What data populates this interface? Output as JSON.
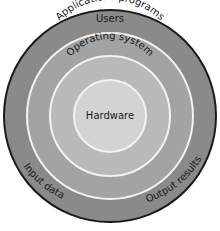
{
  "diagram": {
    "layers": [
      {
        "label": "Users",
        "color": "#8a8a8a"
      },
      {
        "label": "Applications programs",
        "color": "#a3a3a3"
      },
      {
        "label": "Operating system",
        "color": "#b9b9b9"
      },
      {
        "label": "Hardware",
        "color": "#d3d3d3"
      }
    ],
    "side_labels": {
      "left": "Input data",
      "right": "Output results"
    },
    "colors": {
      "outline": "#1a1a1a",
      "separator": "#f2f2f2"
    }
  }
}
